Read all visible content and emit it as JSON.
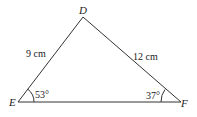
{
  "diagram": {
    "type": "triangle",
    "vertices": [
      {
        "name": "D",
        "label": "D"
      },
      {
        "name": "E",
        "label": "E"
      },
      {
        "name": "F",
        "label": "F"
      }
    ],
    "sides": [
      {
        "between": "DE",
        "label": "9 cm"
      },
      {
        "between": "DF",
        "label": "12 cm"
      }
    ],
    "angles": [
      {
        "at": "E",
        "label": "53°"
      },
      {
        "at": "F",
        "label": "37°"
      }
    ],
    "stroke_color": "#333333"
  }
}
